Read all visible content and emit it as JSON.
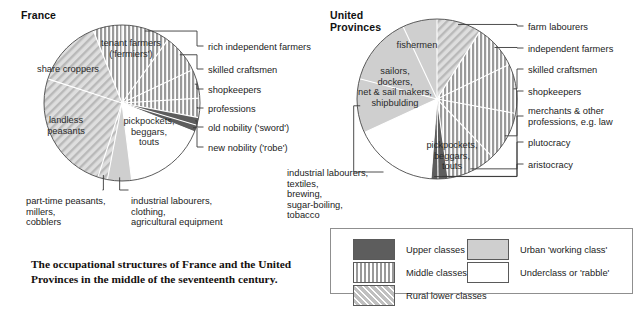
{
  "figure": {
    "caption": "The occupational structures of France and the United\nProvinces in the middle of the seventeenth century."
  },
  "charts": [
    {
      "id": "france",
      "title": "France",
      "center": [
        122,
        103
      ],
      "radius": 78,
      "title_pos": [
        21,
        10
      ],
      "slices": [
        {
          "label": "farm labourers-hidden",
          "value": 0,
          "klass": "none",
          "hidden": true
        }
      ]
    },
    {
      "id": "united-provinces",
      "title": "United\nProvinces",
      "center": [
        437,
        99
      ],
      "radius": 80,
      "title_pos": [
        330,
        10
      ]
    }
  ],
  "chart_data": [
    {
      "type": "pie",
      "title": "France",
      "center": [
        122,
        103
      ],
      "radius": 78,
      "start_angle_deg": -90,
      "direction": "clockwise",
      "categories": [
        "rich independent farmers",
        "skilled craftsmen",
        "shopkeepers",
        "professions",
        "old nobility ('sword')",
        "new nobility ('robe')",
        "pickpockets, beggars, touts",
        "industrial labourers, clothing, agricultural equipment",
        "part-time peasants, millers, cobblers",
        "landless peasants",
        "share croppers",
        "tenant farmers ('fermiers')"
      ],
      "values": [
        10.0,
        8.0,
        6.0,
        4.0,
        1.6,
        1.4,
        17.0,
        5.0,
        2.0,
        25.0,
        14.0,
        6.0
      ],
      "class_of_slice": [
        "middle",
        "middle",
        "middle",
        "middle",
        "upper",
        "upper",
        "under",
        "urban",
        "rural",
        "rural",
        "rural",
        "middle"
      ],
      "legend_position": "below-right",
      "grid": false
    },
    {
      "type": "pie",
      "title": "United Provinces",
      "center": [
        437,
        99
      ],
      "radius": 80,
      "start_angle_deg": -90,
      "direction": "clockwise",
      "categories": [
        "farm labourers",
        "independent farmers",
        "skilled craftsmen",
        "shopkeepers",
        "merchants & other professions, e.g. law",
        "plutocracy",
        "aristocracy",
        "pickpockets, beggars, touts",
        "industrial labourers, textiles, brewing, sugar-boiling, tobacco",
        "sailors, dockers, net & sail makers, shipbulding",
        "fishermen"
      ],
      "values": [
        9.0,
        9.0,
        10.0,
        10.0,
        10.0,
        2.0,
        1.4,
        17.0,
        11.0,
        14.0,
        7.0
      ],
      "class_of_slice": [
        "rural",
        "middle",
        "middle",
        "middle",
        "middle",
        "upper",
        "upper",
        "under",
        "urban",
        "urban",
        "urban"
      ],
      "legend_position": "below-right",
      "grid": false
    }
  ],
  "france_labels": {
    "inside": [
      {
        "name": "tenant-farmers",
        "text": "tenant farmers\n('fermiers')",
        "x": 93,
        "y": 38,
        "w": 76
      },
      {
        "name": "share-croppers",
        "text": "share croppers",
        "x": 29,
        "y": 64,
        "w": 78
      },
      {
        "name": "landless-peasants",
        "text": "landless\npeasants",
        "x": 38,
        "y": 115,
        "w": 56
      },
      {
        "name": "pickpockets",
        "text": "pickpockets,\nbeggars,\ntouts",
        "x": 116,
        "y": 116,
        "w": 66
      }
    ],
    "callouts_right": [
      {
        "name": "rich-independent-farmers",
        "text": "rich independent farmers",
        "x": 208,
        "y": 42
      },
      {
        "name": "skilled-craftsmen",
        "text": "skilled craftsmen",
        "x": 208,
        "y": 65
      },
      {
        "name": "shopkeepers",
        "text": "shopkeepers",
        "x": 208,
        "y": 85
      },
      {
        "name": "professions",
        "text": "professions",
        "x": 208,
        "y": 104
      },
      {
        "name": "old-nobility",
        "text": "old nobility ('sword')",
        "x": 208,
        "y": 123
      },
      {
        "name": "new-nobility",
        "text": "new nobility ('robe')",
        "x": 208,
        "y": 143
      }
    ],
    "callouts_bottom": [
      {
        "name": "part-time-peasants",
        "text": "part-time peasants,\nmillers,\ncobblers",
        "x": 26,
        "y": 196
      },
      {
        "name": "industrial-labourers-fr",
        "text": "industrial labourers,\nclothing,\nagricultural equipment",
        "x": 131,
        "y": 196
      }
    ]
  },
  "up_labels": {
    "inside": [
      {
        "name": "fishermen",
        "text": "fishermen",
        "x": 384,
        "y": 40,
        "w": 66
      },
      {
        "name": "sailors-dockers",
        "text": "sailors,\ndockers,\nnet & sail makers,\nshipbulding",
        "x": 343,
        "y": 66,
        "w": 104
      },
      {
        "name": "pickpockets-up",
        "text": "pickpockets,\nbeggars,\ntouts",
        "x": 419,
        "y": 140,
        "w": 66
      }
    ],
    "callouts_right": [
      {
        "name": "farm-labourers",
        "text": "farm labourers",
        "x": 528,
        "y": 22
      },
      {
        "name": "independent-farmers",
        "text": "independent farmers",
        "x": 528,
        "y": 44
      },
      {
        "name": "skilled-craftsmen-up",
        "text": "skilled craftsmen",
        "x": 528,
        "y": 65
      },
      {
        "name": "shopkeepers-up",
        "text": "shopkeepers",
        "x": 528,
        "y": 87
      },
      {
        "name": "merchants",
        "text": "merchants & other\nprofessions, e.g. law",
        "x": 528,
        "y": 106
      },
      {
        "name": "plutocracy",
        "text": "plutocracy",
        "x": 528,
        "y": 138
      },
      {
        "name": "aristocracy",
        "text": "aristocracy",
        "x": 528,
        "y": 160
      }
    ],
    "callouts_left": [
      {
        "name": "industrial-labourers-up",
        "text": "industrial labourers,\ntextiles,\nbrewing,\nsugar-boiling,\ntobacco",
        "x": 287,
        "y": 168
      }
    ]
  },
  "legend": {
    "items": [
      {
        "name": "legend-upper-classes",
        "label": "Upper classes",
        "pattern": "upper",
        "col": 0,
        "row": 0
      },
      {
        "name": "legend-middle-classes",
        "label": "Middle classes",
        "pattern": "middle",
        "col": 0,
        "row": 1
      },
      {
        "name": "legend-rural-lower",
        "label": "Rural lower classes",
        "pattern": "rural",
        "col": 0,
        "row": 2
      },
      {
        "name": "legend-urban-working",
        "label": "Urban 'working class'",
        "pattern": "urban",
        "col": 1,
        "row": 0
      },
      {
        "name": "legend-underclass",
        "label": "Underclass or 'rabble'",
        "pattern": "under",
        "col": 1,
        "row": 1
      }
    ]
  },
  "colors": {
    "upper": "#5d5d5d",
    "middle_base": "#9a9a9a",
    "rural_base": "#d6d6d6",
    "urban": "#cfcfcf",
    "under": "#ffffff",
    "outline": "#4a4a4a",
    "divider": "#ffffff",
    "leader": "#3a3a3a",
    "legend_border": "#8f8f8f",
    "text": "#222222"
  }
}
